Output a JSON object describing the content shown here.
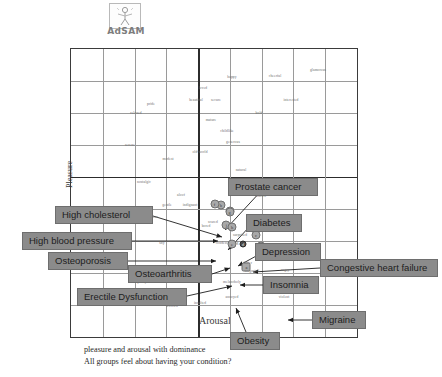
{
  "logo": {
    "name": "AdSAM",
    "icon": "adsam-manikin-icon"
  },
  "caption": {
    "line1": "pleasure and arousal with dominance",
    "line2": "All groups feel about having your condition?"
  },
  "chart_data": {
    "type": "scatter",
    "title": "",
    "xlabel": "Arousal",
    "ylabel": "Pleasure",
    "xlim": [
      -4.5,
      4.5
    ],
    "ylim": [
      -4.5,
      4.5
    ],
    "grid": true,
    "legend": "none",
    "axis_style": "emphasized-center-cross",
    "grid_divisions": 9,
    "points": [
      {
        "label": "Prostate cancer",
        "marker": "b",
        "x": 0.25,
        "y": -0.42,
        "style": "light"
      },
      {
        "label": "Diabetes",
        "marker": "g",
        "x": 0.55,
        "y": -0.6,
        "style": "light"
      },
      {
        "label": "High cholesterol",
        "marker": "f",
        "x": 0.05,
        "y": -0.38,
        "style": "light"
      },
      {
        "label": "High blood pressure",
        "marker": "g",
        "x": 0.52,
        "y": -0.62,
        "style": "light"
      },
      {
        "label": "Osteoporosis",
        "marker": "j",
        "x": 0.42,
        "y": -1.02,
        "style": "light"
      },
      {
        "label": "Osteoarthritis",
        "marker": "h",
        "x": 0.6,
        "y": -1.1,
        "style": "light"
      },
      {
        "label": "Erectile Dysfunction",
        "marker": "e",
        "x": 0.6,
        "y": -1.62,
        "style": "light"
      },
      {
        "label": "Depression",
        "marker": "c",
        "x": 1.35,
        "y": -1.35,
        "style": "light"
      },
      {
        "label": "Congestive heart failure",
        "marker": "d",
        "x": 0.95,
        "y": -1.62,
        "style": "dark"
      },
      {
        "label": "Insomnia",
        "marker": "i",
        "x": 1.5,
        "y": -1.7,
        "style": "light"
      },
      {
        "label": "Obesity",
        "marker": "a",
        "x": 1.05,
        "y": -2.35,
        "style": "square"
      },
      {
        "label": "Migraine",
        "marker": "",
        "x": 2.6,
        "y": -2.92,
        "style": "dark"
      }
    ],
    "emotion_words": [
      {
        "text": "happy",
        "x": 232,
        "y": 77
      },
      {
        "text": "cheerful",
        "x": 275,
        "y": 76
      },
      {
        "text": "glamorous",
        "x": 318,
        "y": 70
      },
      {
        "text": "loved",
        "x": 203,
        "y": 88
      },
      {
        "text": "beautiful",
        "x": 196,
        "y": 100
      },
      {
        "text": "secure",
        "x": 216,
        "y": 100
      },
      {
        "text": "interested",
        "x": 291,
        "y": 100
      },
      {
        "text": "pride",
        "x": 151,
        "y": 104
      },
      {
        "text": "relaxed",
        "x": 136,
        "y": 113
      },
      {
        "text": "bold",
        "x": 259,
        "y": 113
      },
      {
        "text": "mature",
        "x": 211,
        "y": 120
      },
      {
        "text": "childlike",
        "x": 227,
        "y": 131
      },
      {
        "text": "generous",
        "x": 233,
        "y": 142
      },
      {
        "text": "serene",
        "x": 130,
        "y": 145
      },
      {
        "text": "old-world",
        "x": 200,
        "y": 152
      },
      {
        "text": "modest",
        "x": 168,
        "y": 159
      },
      {
        "text": "natural",
        "x": 241,
        "y": 170
      },
      {
        "text": "nostalgic",
        "x": 144,
        "y": 182
      },
      {
        "text": "aloof",
        "x": 181,
        "y": 195
      },
      {
        "text": "sincere",
        "x": 261,
        "y": 196
      },
      {
        "text": "gentle",
        "x": 167,
        "y": 205
      },
      {
        "text": "indignant",
        "x": 190,
        "y": 205
      },
      {
        "text": "anxious",
        "x": 152,
        "y": 217
      },
      {
        "text": "bored",
        "x": 206,
        "y": 226
      },
      {
        "text": "scared",
        "x": 213,
        "y": 222
      },
      {
        "text": "surprised",
        "x": 240,
        "y": 235
      },
      {
        "text": "condescending",
        "x": 227,
        "y": 243
      },
      {
        "text": "shy",
        "x": 162,
        "y": 243
      },
      {
        "text": "bitter",
        "x": 248,
        "y": 263
      },
      {
        "text": "disgusted",
        "x": 252,
        "y": 271
      },
      {
        "text": "angry",
        "x": 285,
        "y": 270
      },
      {
        "text": "unhappy",
        "x": 200,
        "y": 277
      },
      {
        "text": "melancholy",
        "x": 232,
        "y": 282
      },
      {
        "text": "pushy",
        "x": 142,
        "y": 282
      },
      {
        "text": "reckless",
        "x": 178,
        "y": 293
      },
      {
        "text": "violent",
        "x": 284,
        "y": 297
      },
      {
        "text": "sad",
        "x": 158,
        "y": 301
      },
      {
        "text": "worried",
        "x": 172,
        "y": 306
      },
      {
        "text": "insulted",
        "x": 200,
        "y": 303
      },
      {
        "text": "annoyed",
        "x": 232,
        "y": 297
      }
    ]
  },
  "callouts": [
    {
      "id": "prostate-cancer",
      "label": "Prostate cancer",
      "left": 228,
      "top": 178,
      "width": 90
    },
    {
      "id": "high-cholesterol",
      "label": "High cholesterol",
      "left": 55,
      "top": 206,
      "width": 98
    },
    {
      "id": "diabetes",
      "label": "Diabetes",
      "left": 246,
      "top": 214,
      "width": 56
    },
    {
      "id": "high-blood-pressure",
      "label": "High blood pressure",
      "left": 22,
      "top": 232,
      "width": 110
    },
    {
      "id": "depression",
      "label": "Depression",
      "left": 255,
      "top": 243,
      "width": 66
    },
    {
      "id": "osteoporosis",
      "label": "Osteoporosis",
      "left": 48,
      "top": 252,
      "width": 80
    },
    {
      "id": "osteoarthritis",
      "label": "Osteoarthritis",
      "left": 128,
      "top": 265,
      "width": 84
    },
    {
      "id": "congestive-heart-failure",
      "label": "Congestive heart failure",
      "left": 320,
      "top": 259,
      "width": 118
    },
    {
      "id": "insomnia",
      "label": "Insomnia",
      "left": 263,
      "top": 276,
      "width": 56
    },
    {
      "id": "erectile-dysfunction",
      "label": "Erectile Dysfunction",
      "left": 77,
      "top": 288,
      "width": 110
    },
    {
      "id": "migraine",
      "label": "Migraine",
      "left": 312,
      "top": 311,
      "width": 54
    },
    {
      "id": "obesity",
      "label": "Obesity",
      "left": 230,
      "top": 332,
      "width": 50
    }
  ],
  "colors": {
    "callout_fill": "#8b8b8b",
    "callout_border": "#6e6e6e",
    "grid_line": "#9a9a9a",
    "axis_line": "#2c2c2c",
    "frame": "#3b3b3b",
    "marker_light": "#a8a8a8",
    "marker_dark": "#4a4a4a"
  }
}
